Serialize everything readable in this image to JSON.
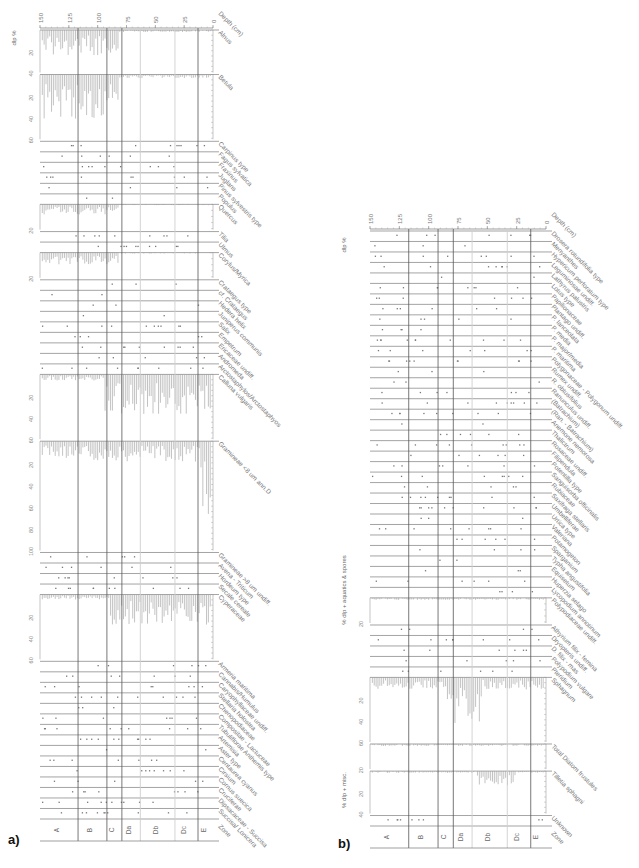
{
  "figure": {
    "panel_a_label": "a)",
    "panel_b_label": "b)"
  },
  "chart_data": [
    {
      "type": "stratigraphic-pollen-diagram",
      "panel": "a",
      "title": "",
      "depth_axis": {
        "label": "Depth (cm)",
        "ticks": [
          150,
          125,
          100,
          75,
          50,
          25,
          0
        ],
        "range": [
          150,
          0
        ],
        "orientation": "horizontal, decreasing to the right"
      },
      "zone_boundaries_depth": [
        117,
        92,
        79,
        63,
        33,
        13
      ],
      "zones": [
        "A",
        "B",
        "C",
        "Da",
        "Db",
        "Dc",
        "E"
      ],
      "zone_label": "Zone",
      "group_axis_labels": [
        "dlp %"
      ],
      "taxa": [
        {
          "name": "Alnus",
          "kind": "curve",
          "max": 40,
          "ticks": [
            20,
            40
          ],
          "peak": 35
        },
        {
          "name": "Betula",
          "kind": "curve",
          "max": 60,
          "ticks": [
            20,
            40,
            60
          ],
          "peak": 60
        },
        {
          "name": "Carpinus type",
          "kind": "dots"
        },
        {
          "name": "Fagus sylvatica",
          "kind": "dots"
        },
        {
          "name": "Fraxinus",
          "kind": "dots"
        },
        {
          "name": "Juglans",
          "kind": "dots"
        },
        {
          "name": "Pinus sylvestris type",
          "kind": "dots"
        },
        {
          "name": "Populus",
          "kind": "dots"
        },
        {
          "name": "Quercus",
          "kind": "curve",
          "max": 20,
          "ticks": [
            20
          ],
          "peak": 12
        },
        {
          "name": "Tilia",
          "kind": "dots"
        },
        {
          "name": "Ulmus",
          "kind": "dots"
        },
        {
          "name": "Corylus/Myrica",
          "kind": "curve",
          "max": 20,
          "ticks": [
            20
          ],
          "peak": 14
        },
        {
          "name": "Crataegus type",
          "kind": "dots"
        },
        {
          "name": "cf. Crataegus",
          "kind": "dots"
        },
        {
          "name": "Hedera helix",
          "kind": "dots"
        },
        {
          "name": "Juniperus communis",
          "kind": "dots"
        },
        {
          "name": "Salix",
          "kind": "dots"
        },
        {
          "name": "Empetrum",
          "kind": "dots"
        },
        {
          "name": "Ericaceae undiff.",
          "kind": "dots"
        },
        {
          "name": "Andromeda",
          "kind": "dots"
        },
        {
          "name": "Arctostaphylos/Arctostaphyos",
          "kind": "dots"
        },
        {
          "name": "Calluna vulgaris",
          "kind": "curve",
          "max": 60,
          "ticks": [
            20,
            40,
            60
          ],
          "peak": 55
        },
        {
          "name": "Gramineae <8 um ann.D",
          "kind": "curve",
          "max": 100,
          "ticks": [
            20,
            40,
            60,
            80,
            100
          ],
          "peak": 90
        },
        {
          "name": "Gramineae >8 um undiff.",
          "kind": "dots"
        },
        {
          "name": "Avena - Triticum",
          "kind": "dots"
        },
        {
          "name": "Hordeum type",
          "kind": "dots"
        },
        {
          "name": "Secale cereale",
          "kind": "dots"
        },
        {
          "name": "Cyperaceae",
          "kind": "curve",
          "max": 60,
          "ticks": [
            20,
            40,
            60
          ],
          "peak": 45
        },
        {
          "name": "Armeria maritima",
          "kind": "dots"
        },
        {
          "name": "Cannabis/Humulus",
          "kind": "dots"
        },
        {
          "name": "Caryophyllaceae undiff.",
          "kind": "dots"
        },
        {
          "name": "Stellaria holostea",
          "kind": "dots"
        },
        {
          "name": "Chenopodiaceae",
          "kind": "dots"
        },
        {
          "name": "Compositae - Lactuceae",
          "kind": "dots"
        },
        {
          "name": "Tubuliflorae Anthemis type",
          "kind": "dots"
        },
        {
          "name": "Artemisia",
          "kind": "dots"
        },
        {
          "name": "Aster type",
          "kind": "dots"
        },
        {
          "name": "Centaurea cyanus",
          "kind": "dots"
        },
        {
          "name": "Cirsium",
          "kind": "dots"
        },
        {
          "name": "Cornus suecica",
          "kind": "dots"
        },
        {
          "name": "Cruciferae",
          "kind": "dots"
        },
        {
          "name": "Dipsacaceae - Succisa",
          "kind": "dots"
        },
        {
          "name": "Succisa/ Lonicera",
          "kind": "dots"
        }
      ]
    },
    {
      "type": "stratigraphic-pollen-diagram",
      "panel": "b",
      "title": "",
      "depth_axis": {
        "label": "Depth (cm)",
        "ticks": [
          150,
          125,
          100,
          75,
          50,
          25,
          0
        ],
        "range": [
          150,
          0
        ],
        "orientation": "horizontal, decreasing to the right"
      },
      "zone_boundaries_depth": [
        117,
        92,
        79,
        63,
        33,
        13
      ],
      "zones": [
        "A",
        "B",
        "C",
        "Da",
        "Db",
        "Dc",
        "E"
      ],
      "zone_label": "Zone",
      "group_axis_labels": [
        "dlp %",
        "% dlp + aquatics & spores",
        "% dlp + misc."
      ],
      "taxa": [
        {
          "name": "Drosera rotundifolia type",
          "kind": "dots"
        },
        {
          "name": "Menyanthes",
          "kind": "dots"
        },
        {
          "name": "Hypericum perforatum type",
          "kind": "dots"
        },
        {
          "name": "Leguminosae undiff.",
          "kind": "dots"
        },
        {
          "name": "Lathyrus palustris",
          "kind": "dots"
        },
        {
          "name": "Lotus type",
          "kind": "dots"
        },
        {
          "name": "Papilionaceae",
          "kind": "dots"
        },
        {
          "name": "Plantago undiff.",
          "kind": "dots"
        },
        {
          "name": "P. lanceolata",
          "kind": "dots"
        },
        {
          "name": "P. media",
          "kind": "dots"
        },
        {
          "name": "P. major/media",
          "kind": "dots"
        },
        {
          "name": "P. maritima",
          "kind": "dots"
        },
        {
          "name": "Polygonaceae - Polygonum undiff.",
          "kind": "dots"
        },
        {
          "name": "Rumex undiff.",
          "kind": "dots"
        },
        {
          "name": "R. obtusifolius",
          "kind": "dots"
        },
        {
          "name": "Ranunculus undiff.",
          "kind": "dots"
        },
        {
          "name": "(Batrachium)",
          "kind": "dots"
        },
        {
          "name": "(Ran. - Batrachium)",
          "kind": "dots"
        },
        {
          "name": "Anemone nemorosa",
          "kind": "dots"
        },
        {
          "name": "Thalictrum",
          "kind": "dots"
        },
        {
          "name": "Rosaceae undiff.",
          "kind": "dots"
        },
        {
          "name": "Filipendula",
          "kind": "dots"
        },
        {
          "name": "Potentilla type",
          "kind": "dots"
        },
        {
          "name": "Sanguisorba officinalis",
          "kind": "dots"
        },
        {
          "name": "Rubiaceae",
          "kind": "dots"
        },
        {
          "name": "Saxifraga stellaris",
          "kind": "dots"
        },
        {
          "name": "Umbelliferae",
          "kind": "dots"
        },
        {
          "name": "Urtica type",
          "kind": "dots"
        },
        {
          "name": "Valeriana",
          "kind": "dots"
        },
        {
          "name": "Potamogeton",
          "kind": "dots"
        },
        {
          "name": "Sparganium",
          "kind": "dots"
        },
        {
          "name": "Typha angustifolia",
          "kind": "dots"
        },
        {
          "name": "Equisetum",
          "kind": "dots"
        },
        {
          "name": "Huperzia selago",
          "kind": "dots"
        },
        {
          "name": "Lycopodium annotinum",
          "kind": "dots"
        },
        {
          "name": "Polypodiaceae undiff.",
          "kind": "curve",
          "max": 20,
          "ticks": [
            20
          ],
          "peak": 8
        },
        {
          "name": "Athyrium filix - femina",
          "kind": "dots"
        },
        {
          "name": "Dryopteris undiff.",
          "kind": "dots"
        },
        {
          "name": "D. filix - mas",
          "kind": "dots"
        },
        {
          "name": "Polypodium vulgare",
          "kind": "dots"
        },
        {
          "name": "Pteridium",
          "kind": "dots"
        },
        {
          "name": "Sphagnum",
          "kind": "curve",
          "max": 60,
          "ticks": [
            20,
            40,
            60
          ],
          "peak": 65
        },
        {
          "name": "Total Diatom frustules",
          "kind": "curve",
          "max": 20,
          "ticks": [
            20
          ],
          "peak": 8
        },
        {
          "name": "Tilletia sphagni",
          "kind": "curve",
          "max": 40,
          "ticks": [
            20,
            40
          ],
          "peak": 25
        },
        {
          "name": "Unknown",
          "kind": "dots"
        }
      ]
    }
  ]
}
